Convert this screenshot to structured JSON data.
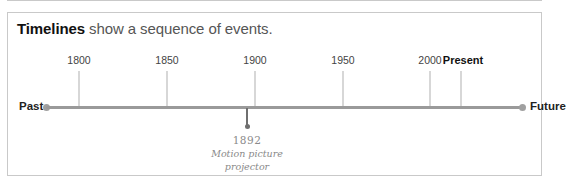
{
  "title": {
    "bold": "Timelines",
    "rest": " show a sequence of events."
  },
  "timeline": {
    "start_label": "Past",
    "end_label": "Future",
    "ticks": [
      {
        "label": "1800",
        "x": 71
      },
      {
        "label": "1850",
        "x": 159
      },
      {
        "label": "1900",
        "x": 247
      },
      {
        "label": "1950",
        "x": 335
      },
      {
        "label": "2000",
        "x": 422
      },
      {
        "label": "Present",
        "x": 453
      }
    ],
    "events": [
      {
        "year": "1892",
        "line1": "Motion picture",
        "line2": "projector",
        "x": 239
      }
    ]
  },
  "colors": {
    "axis": "#9a9a9a",
    "tick": "#d7d7d7",
    "event": "#6f6f6f",
    "border": "#c9c9c9"
  }
}
